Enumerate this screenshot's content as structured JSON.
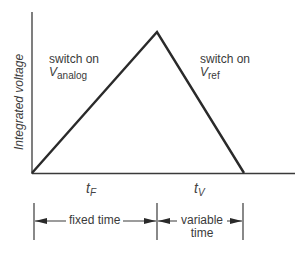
{
  "diagram": {
    "type": "integrating ADC waveform (dual-slope)",
    "y_axis_label": "Integrated voltage",
    "phases": [
      {
        "label_line1": "switch on",
        "label_var": "V",
        "label_sub": "analog"
      },
      {
        "label_line1": "switch on",
        "label_var": "V",
        "label_sub": "ref"
      }
    ],
    "time_labels": [
      {
        "var": "t",
        "sub": "F"
      },
      {
        "var": "t",
        "sub": "V"
      }
    ],
    "dimensions": [
      {
        "label": "fixed time"
      },
      {
        "label_line1": "variable",
        "label_line2": "time"
      }
    ],
    "colors": {
      "line": "#2a2a2a",
      "text": "#3a3a3a",
      "background": "#ffffff"
    },
    "geometry": {
      "origin": [
        32,
        173
      ],
      "peak": [
        157,
        32
      ],
      "end": [
        244,
        173
      ],
      "axis_top": 12,
      "axis_right": 295
    }
  }
}
